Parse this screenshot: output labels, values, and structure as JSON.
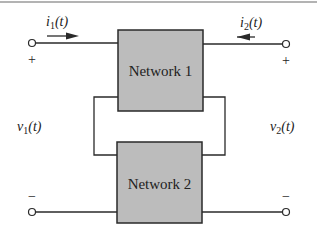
{
  "diagram": {
    "networks": [
      {
        "label": "Network 1",
        "fill": "#bcbcbc"
      },
      {
        "label": "Network 2",
        "fill": "#bcbcbc"
      }
    ],
    "currents": {
      "i1": {
        "base": "i",
        "sub": "1",
        "arg": "(t)"
      },
      "i2": {
        "base": "i",
        "sub": "2",
        "arg": "(t)"
      }
    },
    "voltages": {
      "v1": {
        "base": "v",
        "sub": "1",
        "arg": "(t)"
      },
      "v2": {
        "base": "v",
        "sub": "2",
        "arg": "(t)"
      }
    },
    "polarity": {
      "left_top": "+",
      "right_top": "+",
      "left_bottom": "−",
      "right_bottom": "−"
    },
    "colors": {
      "wire": "#2a2a2a",
      "box_fill": "#bcbcbc",
      "frame_line": "#9a9a9a"
    }
  }
}
